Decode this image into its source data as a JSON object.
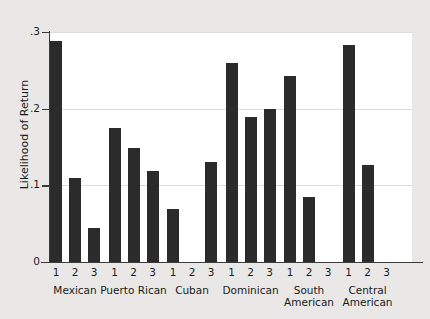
{
  "chart_data": {
    "type": "bar",
    "title": "",
    "xlabel": "",
    "ylabel": "Likelihood of Return",
    "ylim": [
      0,
      0.3
    ],
    "yticks": [
      "0",
      ".1",
      ".2",
      ".3"
    ],
    "ytick_values": [
      0,
      0.1,
      0.2,
      0.3
    ],
    "grid": true,
    "legend": "none",
    "group_labels": [
      "Mexican",
      "Puerto Rican",
      "Cuban",
      "Dominican",
      "South American",
      "Central American"
    ],
    "subcategories": [
      "1",
      "2",
      "3"
    ],
    "groups": [
      {
        "name": "Mexican",
        "values": [
          0.288,
          0.11,
          0.044
        ]
      },
      {
        "name": "Puerto Rican",
        "values": [
          0.175,
          0.149,
          0.119
        ]
      },
      {
        "name": "Cuban",
        "values": [
          0.069,
          0.0,
          0.131
        ]
      },
      {
        "name": "Dominican",
        "values": [
          0.259,
          0.189,
          0.2
        ]
      },
      {
        "name": "South American",
        "values": [
          0.243,
          0.085,
          0.0
        ]
      },
      {
        "name": "Central American",
        "values": [
          0.283,
          0.126,
          0.0
        ]
      }
    ],
    "bar_color": "#2b2b2b",
    "panel_color": "#ffffff",
    "background_color": "#e9e8e6"
  }
}
